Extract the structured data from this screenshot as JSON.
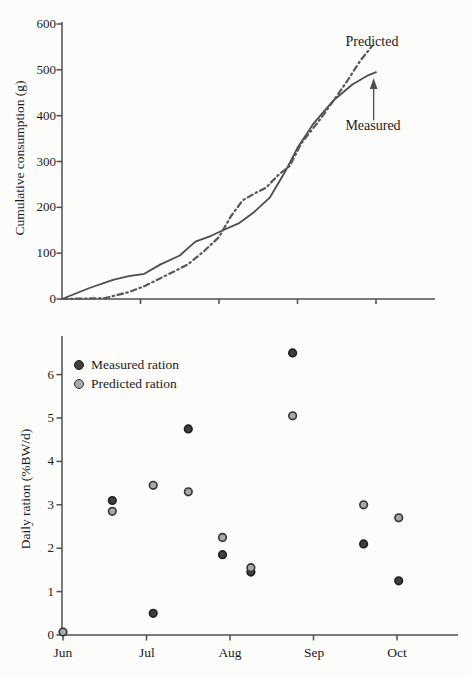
{
  "page": {
    "background": "#fcfcfb"
  },
  "colors": {
    "axis": "#4f4f4f",
    "text": "#1b1b1b",
    "measured_line": "#4d4d4d",
    "predicted_line": "#585858",
    "measured_marker_fill": "#3f3f3f",
    "measured_marker_stroke": "#1f1f1f",
    "predicted_marker_fill": "#a8a8a8",
    "predicted_marker_stroke": "#333333"
  },
  "chart_data": [
    {
      "id": "cumulative-consumption",
      "type": "line",
      "title": "",
      "xlabel": "",
      "ylabel": "Cumulative consumption (g)",
      "ylim": [
        0,
        600
      ],
      "yticks": [
        0,
        100,
        200,
        300,
        400,
        500,
        600
      ],
      "xlim_months": [
        0,
        4.75
      ],
      "xtick_months": [
        1,
        2,
        3,
        4
      ],
      "grid": false,
      "legend_position": "none",
      "series": [
        {
          "name": "Measured",
          "style": "solid",
          "color": "#4d4d4d",
          "points": [
            [
              0,
              0
            ],
            [
              0.35,
              24
            ],
            [
              0.65,
              42
            ],
            [
              0.85,
              50
            ],
            [
              1.05,
              55
            ],
            [
              1.25,
              75
            ],
            [
              1.5,
              95
            ],
            [
              1.7,
              125
            ],
            [
              1.9,
              138
            ],
            [
              2.05,
              150
            ],
            [
              2.25,
              165
            ],
            [
              2.45,
              190
            ],
            [
              2.65,
              222
            ],
            [
              2.85,
              280
            ],
            [
              3.0,
              330
            ],
            [
              3.2,
              382
            ],
            [
              3.45,
              432
            ],
            [
              3.7,
              468
            ],
            [
              3.9,
              488
            ],
            [
              4.0,
              495
            ]
          ]
        },
        {
          "name": "Predicted",
          "style": "dashed",
          "color": "#585858",
          "points": [
            [
              0,
              0
            ],
            [
              0.55,
              2
            ],
            [
              0.85,
              15
            ],
            [
              1.05,
              28
            ],
            [
              1.25,
              45
            ],
            [
              1.45,
              62
            ],
            [
              1.6,
              75
            ],
            [
              1.8,
              103
            ],
            [
              2.0,
              135
            ],
            [
              2.15,
              180
            ],
            [
              2.3,
              215
            ],
            [
              2.45,
              230
            ],
            [
              2.6,
              243
            ],
            [
              2.75,
              270
            ],
            [
              2.9,
              290
            ],
            [
              3.05,
              340
            ],
            [
              3.3,
              395
            ],
            [
              3.5,
              443
            ],
            [
              3.65,
              480
            ],
            [
              3.8,
              520
            ],
            [
              3.95,
              552
            ]
          ]
        }
      ],
      "annotations": {
        "predicted": {
          "text": "Predicted",
          "x": 3.95,
          "y": 560
        },
        "measured": {
          "text": "Measured",
          "x": 3.96,
          "y": 375
        },
        "arrow": {
          "x": 3.97,
          "y_from": 390,
          "y_to": 482
        }
      }
    },
    {
      "id": "daily-ration",
      "type": "scatter",
      "title": "",
      "xlabel": "",
      "ylabel": "Daily ration (%BW/d)",
      "ylim": [
        0,
        6.8
      ],
      "yticks": [
        0,
        1,
        2,
        3,
        4,
        5,
        6
      ],
      "xtick_labels": [
        "Jun",
        "Jul",
        "Aug",
        "Sep",
        "Oct"
      ],
      "xtick_months": [
        0,
        1,
        2,
        3,
        4
      ],
      "grid": false,
      "legend_position": "upper-left",
      "legend": [
        {
          "label": "Measured ration",
          "marker_fill": "#3f3f3f",
          "marker_stroke": "#1f1f1f"
        },
        {
          "label": "Predicted ration",
          "marker_fill": "#a8a8a8",
          "marker_stroke": "#333333"
        }
      ],
      "series": [
        {
          "name": "Measured ration",
          "marker_fill": "#3f3f3f",
          "marker_stroke": "#1f1f1f",
          "points": [
            [
              0.59,
              3.1
            ],
            [
              1.08,
              0.5
            ],
            [
              1.5,
              4.75
            ],
            [
              1.91,
              1.85
            ],
            [
              2.25,
              1.45
            ],
            [
              2.75,
              6.5
            ],
            [
              3.6,
              2.1
            ],
            [
              4.02,
              1.25
            ]
          ]
        },
        {
          "name": "Predicted ration",
          "marker_fill": "#a8a8a8",
          "marker_stroke": "#333333",
          "points": [
            [
              0.0,
              0.07
            ],
            [
              0.59,
              2.85
            ],
            [
              1.08,
              3.45
            ],
            [
              1.5,
              3.3
            ],
            [
              1.91,
              2.25
            ],
            [
              2.25,
              1.55
            ],
            [
              2.75,
              5.05
            ],
            [
              3.6,
              3.0
            ],
            [
              4.02,
              2.7
            ]
          ]
        }
      ]
    }
  ]
}
